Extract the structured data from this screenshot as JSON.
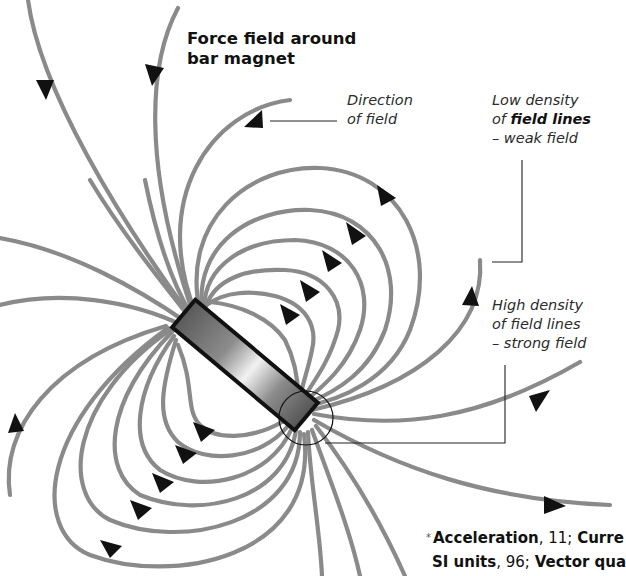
{
  "title": {
    "line1": "Force field around",
    "line2": "bar magnet"
  },
  "labels": {
    "direction": {
      "line1": "Direction",
      "line2": "of field"
    },
    "low_density": {
      "line1": "Low density",
      "line2_prefix": "of ",
      "line2_bold": "field lines",
      "line3": "– weak field"
    },
    "high_density": {
      "line1": "High density",
      "line2": "of field lines",
      "line3": "– strong field"
    }
  },
  "footer": {
    "star": "*",
    "line1": [
      {
        "text": "Acceleration",
        "bold": true
      },
      {
        "text": ", 11; ",
        "bold": false
      },
      {
        "text": "Curre",
        "bold": true
      }
    ],
    "line2": [
      {
        "text": "SI units",
        "bold": true
      },
      {
        "text": ", 96; ",
        "bold": false
      },
      {
        "text": "Vector qua",
        "bold": true
      }
    ]
  },
  "colors": {
    "field_line": "#8a8a8a",
    "arrow": "#111111",
    "magnet_outline": "#111111",
    "magnet_fill_dark": "#5a5a5a",
    "magnet_fill_light": "#f2f2f2"
  },
  "icons": {
    "arrow": "triangle-arrowhead",
    "magnet": "bar-magnet",
    "highlight": "circle-callout"
  }
}
